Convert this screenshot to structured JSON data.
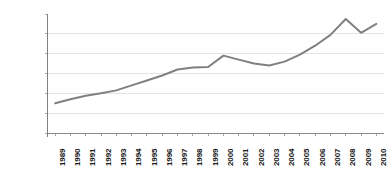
{
  "chart_data": {
    "type": "line",
    "title": "",
    "subtitle": "",
    "xlabel": "",
    "ylabel": "",
    "categories": [
      "1989",
      "1990",
      "1991",
      "1992",
      "1993",
      "1994",
      "1995",
      "1996",
      "1997",
      "1998",
      "1999",
      "2000",
      "2001",
      "2002",
      "2003",
      "2004",
      "2005",
      "2006",
      "2007",
      "2008",
      "2009",
      "2010"
    ],
    "values": [
      300,
      340,
      375,
      400,
      430,
      480,
      530,
      580,
      640,
      660,
      665,
      780,
      740,
      700,
      680,
      720,
      790,
      880,
      990,
      1150,
      1010,
      1100
    ],
    "series": [
      {
        "name": "",
        "values": [
          300,
          340,
          375,
          400,
          430,
          480,
          530,
          580,
          640,
          660,
          665,
          780,
          740,
          700,
          680,
          720,
          790,
          880,
          990,
          1150,
          1010,
          1100
        ]
      }
    ],
    "ylim": [
      0,
      1200
    ],
    "ytick_values": [
      0,
      200,
      400,
      600,
      800,
      1000,
      1200
    ],
    "ytick_labels": [
      "$0",
      "$200",
      "$400",
      "$600",
      "$800",
      "$1,000",
      "$1,200"
    ],
    "xtick_labels": [
      "1989",
      "1990",
      "1991",
      "1992",
      "1993",
      "1994",
      "1995",
      "1996",
      "1997",
      "1998",
      "1999",
      "2000",
      "2001",
      "2002",
      "2003",
      "2004",
      "2005",
      "2006",
      "2007",
      "2008",
      "2009",
      "2010"
    ],
    "grid": true,
    "grid_axis": "y",
    "legend": false,
    "legend_position": "none",
    "line_color": "#808080",
    "grid_color": "#d9d9d9",
    "axis_color": "#808080",
    "background_color": "#ffffff",
    "text_color": "#1a1a1a"
  }
}
